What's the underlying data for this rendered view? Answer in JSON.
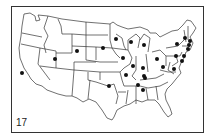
{
  "figure": {
    "label": "17",
    "type": "dot-distribution map of the contiguous United States"
  },
  "colors": {
    "background": "#ffffff",
    "lines": "#333333",
    "dots": "#111111"
  },
  "dots": [
    {
      "state": "CA",
      "x": 22,
      "y": 73
    },
    {
      "state": "UT",
      "x": 55,
      "y": 59
    },
    {
      "state": "WY",
      "x": 77,
      "y": 51
    },
    {
      "state": "SD",
      "x": 103,
      "y": 48
    },
    {
      "state": "MN",
      "x": 116,
      "y": 39
    },
    {
      "state": "WI",
      "x": 131,
      "y": 42
    },
    {
      "state": "MI",
      "x": 144,
      "y": 45
    },
    {
      "state": "IA",
      "x": 123,
      "y": 58
    },
    {
      "state": "IL",
      "x": 133,
      "y": 66
    },
    {
      "state": "IN",
      "x": 143,
      "y": 68
    },
    {
      "state": "OH",
      "x": 157,
      "y": 59
    },
    {
      "state": "WV",
      "x": 163,
      "y": 67
    },
    {
      "state": "MO",
      "x": 126,
      "y": 75
    },
    {
      "state": "KY",
      "x": 144,
      "y": 76
    },
    {
      "state": "KY",
      "x": 145,
      "y": 78
    },
    {
      "state": "TN",
      "x": 138,
      "y": 85
    },
    {
      "state": "AL",
      "x": 143,
      "y": 90
    },
    {
      "state": "OK",
      "x": 109,
      "y": 86
    },
    {
      "state": "NY",
      "x": 177,
      "y": 44
    },
    {
      "state": "VT",
      "x": 185,
      "y": 38
    },
    {
      "state": "ME",
      "x": 190,
      "y": 41
    },
    {
      "state": "MA",
      "x": 189,
      "y": 45
    },
    {
      "state": "CT",
      "x": 188,
      "y": 49
    },
    {
      "state": "PA",
      "x": 176,
      "y": 56
    },
    {
      "state": "NJ",
      "x": 184,
      "y": 56
    },
    {
      "state": "MD",
      "x": 182,
      "y": 61
    },
    {
      "state": "VA",
      "x": 174,
      "y": 69
    }
  ]
}
